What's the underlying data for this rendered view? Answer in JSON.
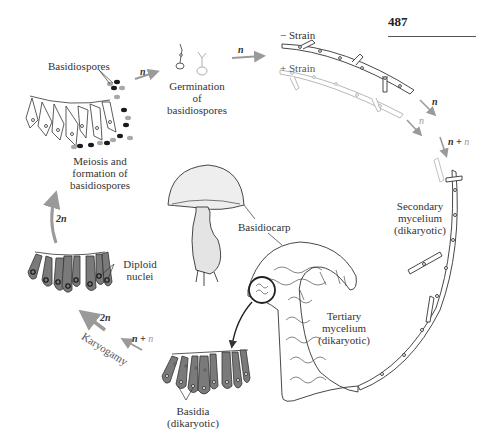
{
  "page": {
    "number": "487"
  },
  "labels": {
    "basidiospores": "Basidiospores",
    "germination": [
      "Germination",
      "of",
      "basidiospores"
    ],
    "minus_strain": "− Strain",
    "plus_strain": "+ Strain",
    "meiosis": [
      "Meiosis and",
      "formation of",
      "basidiospores"
    ],
    "secondary_mycelium": [
      "Secondary",
      "mycelium",
      "(dikaryotic)"
    ],
    "basidiocarp": "Basidiocarp",
    "diploid_nuclei": [
      "Diploid",
      "nuclei"
    ],
    "tertiary_mycelium": [
      "Tertiary",
      "mycelium",
      "(dikaryotic)"
    ],
    "karyogamy": "Karyogamy",
    "basidia": [
      "Basidia",
      "(dikaryotic)"
    ]
  },
  "ploidy": {
    "after_spores": "n",
    "minus_strain_arrow": "n",
    "plus_strain_arrow": "n",
    "fusion_n1": "n",
    "fusion_plus": " + ",
    "fusion_n2": "n",
    "karyogamy_in_n1": "n",
    "karyogamy_in_plus": " + ",
    "karyogamy_in_n2": "n",
    "karyogamy_out": "2n",
    "diploid_up": "2n"
  },
  "colors": {
    "arrow": "#9a9a9a",
    "cell_fill_dark": "#7a7a7a",
    "spore_dark": "#1a1a1a",
    "spore_light": "#a8a8a8",
    "line": "#333333",
    "faded_line": "#b0b0b0"
  }
}
